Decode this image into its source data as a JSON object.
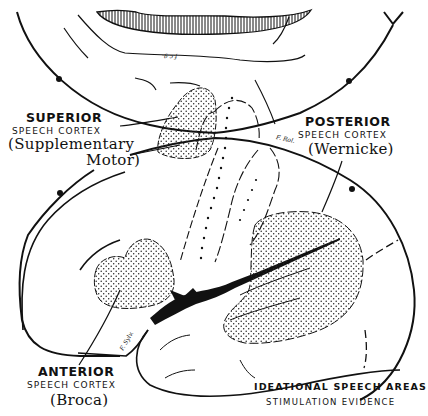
{
  "figure": {
    "caption_line1": "IDEATIONAL SPEECH AREAS",
    "caption_line2": "STIMULATION EVIDENCE"
  },
  "areas": {
    "superior": {
      "title": "SUPERIOR",
      "subtitle": "SPEECH CORTEX",
      "note_line1": "(Supplementary",
      "note_line2": "Motor)"
    },
    "posterior": {
      "title": "POSTERIOR",
      "subtitle": "SPEECH CORTEX",
      "note": "(Wernicke)"
    },
    "anterior": {
      "title": "ANTERIOR",
      "subtitle": "SPEECH CORTEX",
      "note": "(Broca)"
    }
  },
  "fissure_labels": {
    "rolandic": "F. Rol.",
    "sylvian": "F. Sylv.",
    "callosal": "f.c.g."
  },
  "colors": {
    "ink": "#111111",
    "background": "#ffffff"
  }
}
